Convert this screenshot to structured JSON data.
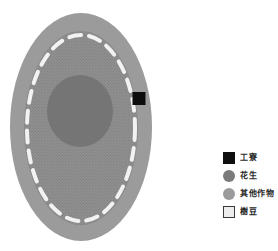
{
  "legend": {
    "items": [
      {
        "label": "工寮",
        "swatch": "square",
        "color": "#0f0f0f"
      },
      {
        "label": "花生",
        "swatch": "circle",
        "color": "#7a7a7a"
      },
      {
        "label": "其他作物",
        "swatch": "circle",
        "color": "#9b9b9b"
      },
      {
        "label": "樹豆",
        "swatch": "square-outline",
        "color": "#ededed"
      }
    ]
  },
  "diagram": {
    "colors": {
      "field_outer": "#9b9b9b",
      "other_crops": "#8f8f8f",
      "peanut": "#767676",
      "boundary_dash": "#f2f2f2",
      "work_hut": "#0d0d0d",
      "texture_dot": "#6b6b6b",
      "background": "#ffffff"
    }
  }
}
